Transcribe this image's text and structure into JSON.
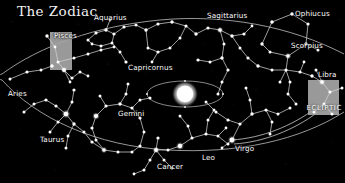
{
  "figure": {
    "title": "The Zodiac",
    "type": "astronomical-diagram",
    "background_color": "#000000",
    "star_color": "#ffffff",
    "line_color": "#c9c9c9",
    "box_color": "#a8a8a8",
    "sun_color": "#ffffff"
  },
  "ecliptic": {
    "label": "ECLIPTIC",
    "has_leader_line": true
  },
  "sun": {
    "name": "sun",
    "cx": 185,
    "cy": 94,
    "r": 11
  },
  "earth_orbit": {
    "name": "earth-orbit",
    "cx": 185,
    "cy": 94,
    "rx": 38,
    "ry": 13,
    "marker_count": 4
  },
  "highlight_boxes": [
    {
      "name": "pisces-box",
      "x": 50,
      "y": 32,
      "w": 22,
      "h": 38
    },
    {
      "name": "libra-box",
      "x": 308,
      "y": 80,
      "w": 30,
      "h": 35
    }
  ],
  "constellations": [
    {
      "name": "Pisces",
      "label": "Pisces",
      "lx": 54,
      "ly": 32,
      "anchor": "left"
    },
    {
      "name": "Aquarius",
      "label": "Aquarius",
      "lx": 94,
      "ly": 14,
      "anchor": "left"
    },
    {
      "name": "Capricornus",
      "label": "Capricornus",
      "lx": 128,
      "ly": 64,
      "anchor": "left"
    },
    {
      "name": "Sagittarius",
      "label": "Sagittarius",
      "lx": 207,
      "ly": 12,
      "anchor": "left"
    },
    {
      "name": "Ophiucus",
      "label": "Ophiucus",
      "lx": 295,
      "ly": 10,
      "anchor": "left"
    },
    {
      "name": "Scorpius",
      "label": "Scorpius",
      "lx": 291,
      "ly": 42,
      "anchor": "left"
    },
    {
      "name": "Libra",
      "label": "Libra",
      "lx": 318,
      "ly": 71,
      "anchor": "left"
    },
    {
      "name": "Virgo",
      "label": "Virgo",
      "lx": 235,
      "ly": 145,
      "anchor": "left"
    },
    {
      "name": "Leo",
      "label": "Leo",
      "lx": 202,
      "ly": 154,
      "anchor": "left"
    },
    {
      "name": "Cancer",
      "label": "Cancer",
      "lx": 157,
      "ly": 163,
      "anchor": "left"
    },
    {
      "name": "Gemini",
      "label": "Gemini",
      "lx": 118,
      "ly": 110,
      "anchor": "left"
    },
    {
      "name": "Taurus",
      "label": "Taurus",
      "lx": 40,
      "ly": 136,
      "anchor": "left"
    },
    {
      "name": "Aries",
      "label": "Aries",
      "lx": 8,
      "ly": 90,
      "anchor": "left"
    }
  ]
}
